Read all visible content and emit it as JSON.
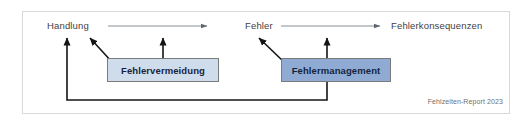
{
  "figure": {
    "caption": "Fehlzeiten-Report 2023",
    "frame_color": "#d9d9d9",
    "background_color": "#ffffff"
  },
  "nodes": [
    {
      "id": "handlung",
      "label": "Handlung"
    },
    {
      "id": "fehler",
      "label": "Fehler"
    },
    {
      "id": "fehlerkonsequenzen",
      "label": "Fehlerkonsequenzen"
    }
  ],
  "boxes": [
    {
      "id": "fehlervermeidung",
      "label": "Fehlervermeidung",
      "fill": "#cfdcec",
      "border": "#7a7a7a",
      "text_color": "#15243d"
    },
    {
      "id": "fehlermanagement",
      "label": "Fehlermanagement",
      "fill": "#8fabd4",
      "border": "#7a7a7a",
      "text_color": "#15243d"
    }
  ],
  "arrows": {
    "flow_color": "#8a8f96",
    "intervention_color": "#1a1a1a",
    "feedback_color": "#1a1a1a",
    "items": [
      {
        "id": "handlung-to-fehler",
        "kind": "flow"
      },
      {
        "id": "fehler-to-fehlerkonsequenzen",
        "kind": "flow"
      },
      {
        "id": "fehlervermeidung-to-handlung",
        "kind": "intervention"
      },
      {
        "id": "fehlervermeidung-up",
        "kind": "intervention"
      },
      {
        "id": "fehlermanagement-to-fehler",
        "kind": "intervention"
      },
      {
        "id": "fehlermanagement-up",
        "kind": "intervention"
      },
      {
        "id": "fehlermanagement-feedback-to-handlung",
        "kind": "feedback"
      }
    ]
  }
}
